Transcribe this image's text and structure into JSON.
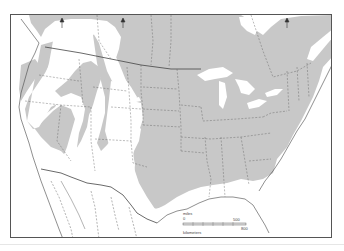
{
  "map": {
    "title": "",
    "region": "North America (United States, southern Canada, northern Mexico)",
    "range_fill_color": "#c8c8c8",
    "background_color": "#ffffff",
    "border_color": "#555555",
    "north_arrows": 3,
    "scale_bar": {
      "miles_label": "miles",
      "miles_start": "0",
      "miles_end": "500",
      "km_label": "kilometers",
      "km_start": "0",
      "km_end": "800"
    }
  }
}
